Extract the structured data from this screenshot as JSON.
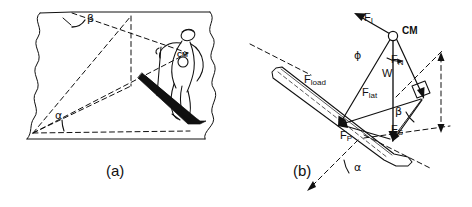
{
  "figure": {
    "type": "physics-free-body-diagram",
    "panels": [
      {
        "id": "a",
        "caption": "(a)",
        "content": "skier traversing an inclined slope plane drawn in perspective with torn paper edges",
        "angles": [
          {
            "symbol": "β",
            "name": "beta",
            "location": "top of slope plane"
          },
          {
            "symbol": "α",
            "name": "alpha",
            "location": "bottom-left vertex"
          }
        ],
        "marker": {
          "label": "CM",
          "name": "center-of-mass"
        }
      },
      {
        "id": "b",
        "caption": "(b)",
        "content": "force vector diagram at the center of mass on a ski",
        "marker": {
          "label": "CM",
          "name": "center-of-mass"
        },
        "forces": [
          {
            "symbol": "F",
            "sub": "I",
            "name": "inertial-force"
          },
          {
            "symbol": "F",
            "sub": "N",
            "name": "normal-force"
          },
          {
            "symbol": "W",
            "sub": "",
            "name": "weight"
          },
          {
            "symbol": "F",
            "sub": "load",
            "name": "load-force"
          },
          {
            "symbol": "F",
            "sub": "lat",
            "name": "lateral-force"
          },
          {
            "symbol": "F",
            "sub": "P",
            "name": "pressure-force"
          },
          {
            "symbol": "F",
            "sub": "S",
            "name": "shear-force"
          }
        ],
        "angles": [
          {
            "symbol": "ϕ",
            "name": "phi",
            "location": "at center of mass"
          },
          {
            "symbol": "β",
            "name": "beta",
            "location": "mid-right"
          },
          {
            "symbol": "α",
            "name": "alpha",
            "location": "bottom"
          }
        ]
      }
    ],
    "colors": {
      "ink": "#101010",
      "background": "#ffffff"
    }
  },
  "labels": {
    "caption_a": "(a)",
    "caption_b": "(b)",
    "cm_a": "CM",
    "cm_b": "CM",
    "alpha_a": "α",
    "beta_a": "β",
    "alpha_b": "α",
    "beta_b": "β",
    "phi_b": "ϕ",
    "W": "W",
    "F": "F",
    "sub_I": "I",
    "sub_N": "N",
    "sub_load": "load",
    "sub_lat": "lat",
    "sub_P": "P",
    "sub_S": "S"
  }
}
